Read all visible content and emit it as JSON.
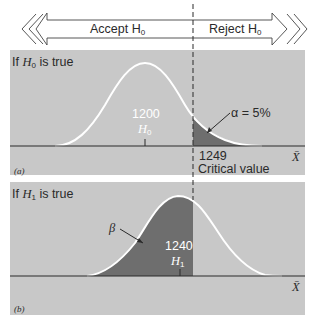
{
  "diagram": {
    "type": "hypothesis-test-illustration",
    "decision_bar": {
      "accept_label": "Accept H",
      "accept_sub": "0",
      "reject_label": "Reject H",
      "reject_sub": "0"
    },
    "panel_a": {
      "tag": "(a)",
      "condition_prefix": "If ",
      "condition_var": "H",
      "condition_sub": "0",
      "condition_suffix": " is true",
      "mean_value": "1200",
      "mean_label": "H",
      "mean_sub": "0",
      "alpha_label": "α = 5%",
      "critical_value": "1249",
      "critical_label": "Critical value",
      "axis_label": "X̄"
    },
    "panel_b": {
      "tag": "(b)",
      "condition_prefix": "If ",
      "condition_var": "H",
      "condition_sub": "1",
      "condition_suffix": " is true",
      "mean_value": "1240",
      "mean_label": "H",
      "mean_sub": "1",
      "beta_label": "β",
      "axis_label": "X̄"
    },
    "colors": {
      "panel_bg": "#c8c8c8",
      "shaded_region": "#6e6e6e",
      "curve": "#ffffff",
      "axis": "#2a2a2a"
    }
  }
}
